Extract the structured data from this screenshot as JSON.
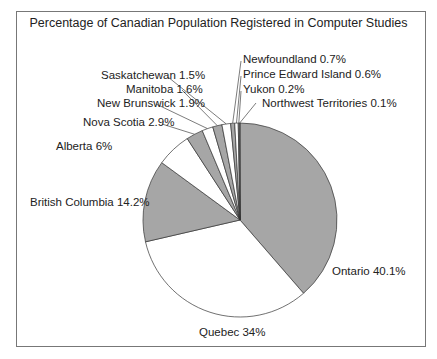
{
  "chart_data": {
    "type": "pie",
    "title": "Percentage of Canadian Population Registered in Computer Studies",
    "categories": [
      "Ontario",
      "Quebec",
      "British Columbia",
      "Alberta",
      "Nova Scotia",
      "New Brunswick",
      "Manitoba",
      "Saskatchewan",
      "Newfoundland",
      "Prince Edward Island",
      "Yukon",
      "Northwest Territories"
    ],
    "values": [
      40.1,
      34,
      14.2,
      6,
      2.9,
      1.9,
      1.6,
      1.5,
      0.7,
      0.6,
      0.2,
      0.1
    ],
    "labels": [
      "Ontario 40.1%",
      "Quebec 34%",
      "British Columbia 14.2%",
      "Alberta 6%",
      "Nova Scotia 2.9%",
      "New Brunswick 1.9%",
      "Manitoba 1.6%",
      "Saskatchewan 1.5%",
      "Newfoundland 0.7%",
      "Prince Edward Island 0.6%",
      "Yukon 0.2%",
      "Northwest Territories 0.1%"
    ],
    "colors": [
      "#a6a6a6",
      "#ffffff",
      "#a6a6a6",
      "#ffffff",
      "#a6a6a6",
      "#ffffff",
      "#a6a6a6",
      "#ffffff",
      "#a6a6a6",
      "#ffffff",
      "#a6a6a6",
      "#ffffff"
    ],
    "start_angle": "12 o'clock, clockwise",
    "legend": "none (callout labels)"
  }
}
